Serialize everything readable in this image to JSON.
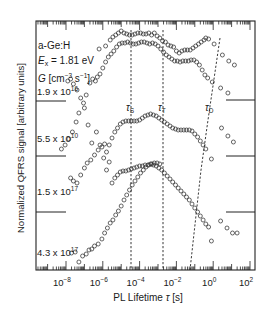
{
  "chart_data": {
    "type": "scatter",
    "title": "",
    "xlabel": "PL Lifetime τ [s]",
    "ylabel": "Normalized QFRS signal [arbitrary units]",
    "xscale": "log",
    "xlim_log10": [
      -9.6,
      2.3
    ],
    "x_ticks": [
      "10^-8",
      "10^-6",
      "10^-4",
      "10^-2",
      "10^0",
      "10^2"
    ],
    "x_tick_values_log10": [
      -8,
      -6,
      -4,
      -2,
      0,
      2
    ],
    "grid": false,
    "annotations": {
      "material": "a-Ge:H",
      "excitation": "E_x = 1.81 eV",
      "generation_label": "G [cm^-3 s^-1]",
      "tau_labels": [
        "τ_S",
        "τ_T",
        "τ_D"
      ],
      "tau_S_log10": -5.0,
      "tau_T_log10": -3.3
    },
    "series": [
      {
        "name": "1.9 x 10^16",
        "note": "offset traces; y in pixel units (smaller = higher)",
        "points_log10tau_ypx": [
          [
            -7.9,
            81
          ],
          [
            -7.75,
            79
          ],
          [
            -7.6,
            84
          ],
          [
            -7.4,
            90
          ],
          [
            -7.2,
            98
          ],
          [
            -7.05,
            103
          ],
          [
            -6.9,
            95
          ],
          [
            -6.7,
            83
          ],
          [
            -6.55,
            79
          ],
          [
            -6.4,
            81
          ],
          [
            -6.3,
            77
          ],
          [
            -6.15,
            74
          ],
          [
            -6.0,
            68
          ],
          [
            -5.85,
            62
          ],
          [
            -5.7,
            57
          ],
          [
            -5.55,
            54
          ],
          [
            -5.4,
            51
          ],
          [
            -5.25,
            47
          ],
          [
            -5.1,
            44
          ],
          [
            -4.95,
            43
          ],
          [
            -4.8,
            43
          ],
          [
            -4.65,
            42
          ],
          [
            -4.5,
            43
          ],
          [
            -4.35,
            44
          ],
          [
            -4.2,
            44
          ],
          [
            -4.05,
            43
          ],
          [
            -3.9,
            42
          ],
          [
            -3.75,
            42
          ],
          [
            -3.6,
            43
          ],
          [
            -3.45,
            44
          ],
          [
            -3.3,
            43
          ],
          [
            -3.15,
            44
          ],
          [
            -3.0,
            46
          ],
          [
            -2.85,
            49
          ],
          [
            -2.7,
            52
          ],
          [
            -2.55,
            55
          ],
          [
            -2.4,
            57
          ],
          [
            -2.25,
            59
          ],
          [
            -2.1,
            61
          ],
          [
            -1.95,
            61
          ],
          [
            -1.8,
            62
          ],
          [
            -1.65,
            61
          ],
          [
            -1.5,
            61
          ],
          [
            -1.35,
            61
          ],
          [
            -1.2,
            60
          ],
          [
            -1.05,
            60
          ],
          [
            -0.9,
            62
          ],
          [
            -0.75,
            65
          ],
          [
            -0.6,
            70
          ],
          [
            -0.45,
            75
          ],
          [
            -0.3,
            78
          ],
          [
            -0.05,
            82
          ],
          [
            0.4,
            88
          ],
          [
            0.8,
            93
          ]
        ]
      },
      {
        "name": "1.9 x 10^16 (upper)",
        "points_log10tau_ypx": [
          [
            -6.2,
            49
          ],
          [
            -5.85,
            46
          ],
          [
            -5.6,
            40
          ],
          [
            -5.45,
            37
          ],
          [
            -5.3,
            35
          ],
          [
            -5.15,
            33
          ],
          [
            -5.0,
            31
          ],
          [
            -4.85,
            33
          ],
          [
            -4.7,
            34
          ],
          [
            -4.55,
            35
          ],
          [
            -4.4,
            35
          ],
          [
            -4.25,
            34
          ],
          [
            -4.1,
            33
          ],
          [
            -3.95,
            33
          ],
          [
            -3.8,
            34
          ],
          [
            -3.65,
            34
          ],
          [
            -3.5,
            33
          ],
          [
            -3.35,
            35
          ],
          [
            -3.2,
            33
          ],
          [
            -3.05,
            36
          ],
          [
            -2.9,
            38
          ],
          [
            -2.75,
            41
          ],
          [
            -2.6,
            42
          ],
          [
            -2.45,
            45
          ],
          [
            -2.3,
            46
          ],
          [
            -2.15,
            47
          ],
          [
            -2.0,
            51
          ],
          [
            -1.85,
            53
          ],
          [
            -1.7,
            51
          ],
          [
            -1.55,
            50
          ],
          [
            -1.4,
            50
          ],
          [
            -1.25,
            50
          ],
          [
            -1.1,
            48
          ],
          [
            -0.95,
            46
          ],
          [
            -0.8,
            44
          ],
          [
            -0.65,
            42
          ],
          [
            -0.5,
            40
          ],
          [
            -0.4,
            38
          ],
          [
            -0.25,
            39
          ],
          [
            0.05,
            44
          ],
          [
            0.5,
            55
          ],
          [
            0.85,
            61
          ],
          [
            1.15,
            65
          ]
        ]
      },
      {
        "name": "5.5 x 10^10",
        "points_log10tau_ypx": [
          [
            -8.25,
            149
          ],
          [
            -8.05,
            145
          ],
          [
            -7.85,
            139
          ],
          [
            -7.65,
            132
          ],
          [
            -7.45,
            122
          ],
          [
            -7.3,
            113
          ],
          [
            -7.0,
            108
          ],
          [
            -6.8,
            125
          ],
          [
            -6.6,
            143
          ],
          [
            -6.35,
            132
          ],
          [
            -6.15,
            145
          ],
          [
            -5.95,
            158
          ],
          [
            -5.8,
            152
          ],
          [
            -5.65,
            145
          ],
          [
            -5.5,
            138
          ],
          [
            -5.35,
            132
          ],
          [
            -5.2,
            128
          ],
          [
            -5.05,
            124
          ],
          [
            -4.9,
            122
          ],
          [
            -4.75,
            121
          ],
          [
            -4.6,
            121
          ],
          [
            -4.45,
            121
          ],
          [
            -4.3,
            121
          ],
          [
            -4.15,
            121
          ],
          [
            -4.0,
            120
          ],
          [
            -3.85,
            118
          ],
          [
            -3.7,
            116
          ],
          [
            -3.55,
            115
          ],
          [
            -3.4,
            114
          ],
          [
            -3.25,
            115
          ],
          [
            -3.1,
            116
          ],
          [
            -2.95,
            118
          ],
          [
            -2.8,
            120
          ],
          [
            -2.65,
            122
          ],
          [
            -2.5,
            124
          ],
          [
            -2.35,
            126
          ],
          [
            -2.2,
            128
          ],
          [
            -2.05,
            129
          ],
          [
            -1.9,
            130
          ],
          [
            -1.75,
            130
          ],
          [
            -1.6,
            130
          ],
          [
            -1.45,
            130
          ],
          [
            -1.3,
            130
          ],
          [
            -1.15,
            131
          ],
          [
            -1.0,
            134
          ],
          [
            -0.85,
            137
          ],
          [
            -0.7,
            141
          ],
          [
            -0.55,
            145
          ],
          [
            -0.4,
            149
          ],
          [
            -0.1,
            159
          ],
          [
            0.45,
            128
          ],
          [
            0.8,
            136
          ],
          [
            1.1,
            142
          ]
        ]
      },
      {
        "name": "1.5 x 10^17",
        "points_log10tau_ypx": [
          [
            -7.75,
            178
          ],
          [
            -7.6,
            181
          ],
          [
            -7.4,
            183
          ],
          [
            -7.2,
            175
          ],
          [
            -7.0,
            168
          ],
          [
            -6.85,
            163
          ],
          [
            -6.65,
            160
          ],
          [
            -6.45,
            155
          ],
          [
            -6.25,
            150
          ],
          [
            -6.05,
            147
          ],
          [
            -5.9,
            144
          ],
          [
            -5.8,
            170
          ],
          [
            -5.65,
            162
          ],
          [
            -5.5,
            183
          ],
          [
            -5.35,
            178
          ],
          [
            -5.2,
            175
          ],
          [
            -5.05,
            172
          ],
          [
            -4.9,
            171
          ],
          [
            -4.75,
            171
          ],
          [
            -4.6,
            170
          ],
          [
            -4.45,
            169
          ],
          [
            -4.3,
            168
          ],
          [
            -4.15,
            167
          ],
          [
            -4.0,
            166
          ],
          [
            -3.85,
            166
          ],
          [
            -3.7,
            165
          ],
          [
            -3.55,
            165
          ],
          [
            -3.4,
            164
          ],
          [
            -3.25,
            165
          ],
          [
            -3.1,
            166
          ],
          [
            -2.95,
            168
          ],
          [
            -2.8,
            170
          ],
          [
            -2.65,
            173
          ],
          [
            -2.5,
            176
          ],
          [
            -2.35,
            179
          ],
          [
            -2.2,
            182
          ],
          [
            -2.05,
            185
          ],
          [
            -1.9,
            188
          ],
          [
            -1.75,
            191
          ],
          [
            -1.6,
            194
          ],
          [
            -1.45,
            197
          ],
          [
            -1.3,
            200
          ],
          [
            -1.15,
            204
          ],
          [
            -1.0,
            208
          ],
          [
            -0.85,
            212
          ],
          [
            -0.7,
            216
          ],
          [
            -0.55,
            220
          ],
          [
            -0.4,
            224
          ],
          [
            -0.25,
            227
          ],
          [
            -0.1,
            241
          ],
          [
            0.4,
            221
          ],
          [
            0.75,
            228
          ],
          [
            1.05,
            233
          ],
          [
            1.3,
            233
          ]
        ]
      },
      {
        "name": "4.3 x 10^17",
        "points_log10tau_ypx": [
          [
            -7.7,
            253
          ],
          [
            -7.5,
            252
          ],
          [
            -7.3,
            262
          ],
          [
            -7.1,
            256
          ],
          [
            -6.9,
            254
          ],
          [
            -6.75,
            250
          ],
          [
            -6.6,
            249
          ],
          [
            -6.45,
            246
          ],
          [
            -6.25,
            244
          ],
          [
            -6.05,
            239
          ],
          [
            -5.9,
            233
          ],
          [
            -5.75,
            228
          ],
          [
            -5.6,
            223
          ],
          [
            -5.45,
            220
          ],
          [
            -5.3,
            215
          ],
          [
            -5.15,
            211
          ],
          [
            -5.0,
            206
          ],
          [
            -4.85,
            200
          ],
          [
            -4.7,
            195
          ],
          [
            -4.55,
            190
          ],
          [
            -4.4,
            185
          ],
          [
            -4.25,
            181
          ],
          [
            -4.1,
            177
          ],
          [
            -3.95,
            173
          ],
          [
            -3.8,
            170
          ],
          [
            -3.65,
            167
          ],
          [
            -3.5,
            165
          ],
          [
            -3.35,
            164
          ],
          [
            -3.2,
            163
          ],
          [
            -3.05,
            163
          ],
          [
            -2.9,
            164
          ]
        ]
      }
    ]
  },
  "labels": {
    "material": "a-Ge:H",
    "ex_prefix": "E",
    "ex_sub": "x",
    "ex_value": " = 1.81 eV",
    "g_symbol": "G",
    "g_units_a": " [cm",
    "g_units_exp1": "−3",
    "g_units_b": " s",
    "g_units_exp2": "−1",
    "g_units_c": "]",
    "curve_1_mant": "1.9 x 10",
    "curve_1_exp": "16",
    "curve_2_mant": "5.5 x 10",
    "curve_2_exp": "10",
    "curve_3_mant": "1.5 x 10",
    "curve_3_exp": "17",
    "curve_4_mant": "4.3 x 10",
    "curve_4_exp": "17",
    "tau_s": "τ",
    "tau_s_sub": "S",
    "tau_t": "τ",
    "tau_t_sub": "T",
    "tau_d": "τ",
    "tau_d_sub": "D",
    "xlabel_a": "PL Lifetime ",
    "xlabel_tau": "τ",
    "xlabel_b": " [s]",
    "ylabel": "Normalized QFRS signal [arbitrary units]",
    "xtick_base": "10",
    "xtick_exps": [
      "−8",
      "−6",
      "−4",
      "−2",
      "0",
      "2"
    ]
  }
}
